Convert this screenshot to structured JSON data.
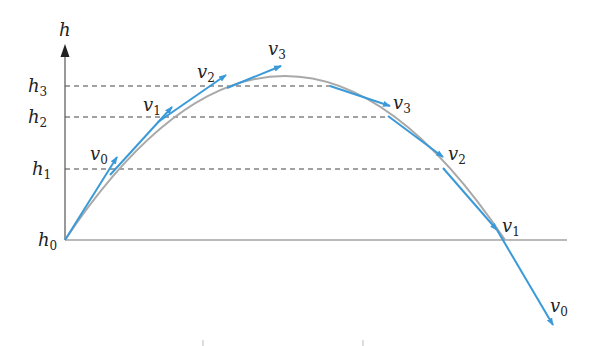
{
  "diagram": {
    "axis_label": "h",
    "colors": {
      "vector": "#3a9ad9",
      "curve": "#a9a9a9",
      "axis": "#555555",
      "dashed": "#444444",
      "text": "#222222"
    },
    "levels": [
      {
        "base": "h",
        "sub": "0"
      },
      {
        "base": "h",
        "sub": "1"
      },
      {
        "base": "h",
        "sub": "2"
      },
      {
        "base": "h",
        "sub": "3"
      }
    ],
    "ascending_vectors": [
      {
        "base": "v",
        "sub": "0"
      },
      {
        "base": "v",
        "sub": "1"
      },
      {
        "base": "v",
        "sub": "2"
      },
      {
        "base": "v",
        "sub": "3"
      }
    ],
    "descending_vectors": [
      {
        "base": "v",
        "sub": "3"
      },
      {
        "base": "v",
        "sub": "2"
      },
      {
        "base": "v",
        "sub": "1"
      },
      {
        "base": "v",
        "sub": "0"
      }
    ]
  }
}
